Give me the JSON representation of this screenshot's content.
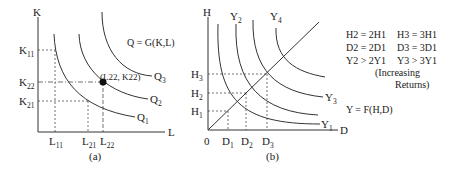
{
  "panel_a": {
    "caption": "(a)",
    "y_axis_label": "K",
    "x_axis_label": "L",
    "function_label": "Q = G(K,L)",
    "point_label": "(L22, K22)",
    "y_ticks": [
      {
        "base": "K",
        "sub": "11"
      },
      {
        "base": "K",
        "sub": "22"
      },
      {
        "base": "K",
        "sub": "21"
      }
    ],
    "x_ticks": [
      {
        "base": "L",
        "sub": "11"
      },
      {
        "base": "L",
        "sub": "21"
      },
      {
        "base": "L",
        "sub": "22"
      }
    ],
    "curves": [
      {
        "base": "Q",
        "sub": "1"
      },
      {
        "base": "Q",
        "sub": "2"
      },
      {
        "base": "Q",
        "sub": "3"
      }
    ]
  },
  "panel_b": {
    "caption": "(b)",
    "y_axis_label": "H",
    "x_axis_label": "D",
    "origin_label": "0",
    "function_label": "Y = F(H,D)",
    "y_ticks": [
      {
        "base": "H",
        "sub": "3"
      },
      {
        "base": "H",
        "sub": "2"
      },
      {
        "base": "H",
        "sub": "1"
      }
    ],
    "x_ticks": [
      {
        "base": "D",
        "sub": "1"
      },
      {
        "base": "D",
        "sub": "2"
      },
      {
        "base": "D",
        "sub": "3"
      }
    ],
    "curves": [
      {
        "base": "Y",
        "sub": "1"
      },
      {
        "base": "Y",
        "sub": "2"
      },
      {
        "base": "Y",
        "sub": "3"
      },
      {
        "base": "Y",
        "sub": "4"
      }
    ],
    "relations": [
      [
        "H2 = 2H1",
        "H3 = 3H1"
      ],
      [
        "D2 = 2D1",
        "D3 = 3D1"
      ],
      [
        "Y2 > 2Y1",
        "Y3 > 3Y1"
      ]
    ],
    "note_line1": "(Increasing",
    "note_line2": "Returns)"
  }
}
